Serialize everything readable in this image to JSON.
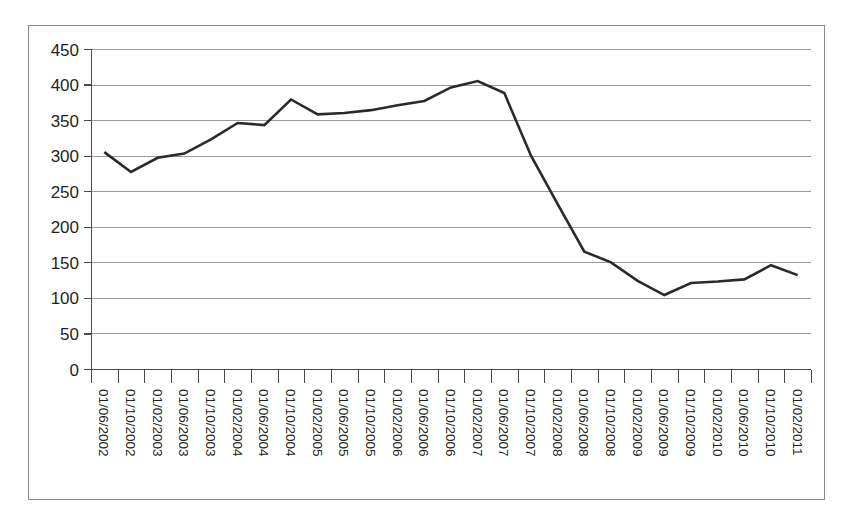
{
  "chart_data": {
    "type": "line",
    "title": "",
    "subtitle": "",
    "xlabel": "",
    "ylabel": "",
    "ylim": [
      0,
      450
    ],
    "ytick_labels": [
      "0",
      "50",
      "100",
      "150",
      "200",
      "250",
      "300",
      "350",
      "400",
      "450"
    ],
    "ytick_values": [
      0,
      50,
      100,
      150,
      200,
      250,
      300,
      350,
      400,
      450
    ],
    "grid": "horizontal",
    "legend": "none",
    "legend_entries": [],
    "annotations": [],
    "categories": [
      "01/06/2002",
      "01/10/2002",
      "01/02/2003",
      "01/06/2003",
      "01/10/2003",
      "01/02/2004",
      "01/06/2004",
      "01/10/2004",
      "01/02/2005",
      "01/06/2005",
      "01/10/2005",
      "01/02/2006",
      "01/06/2006",
      "01/10/2006",
      "01/02/2007",
      "01/06/2007",
      "01/10/2007",
      "01/02/2008",
      "01/06/2008",
      "01/10/2008",
      "01/02/2009",
      "01/06/2009",
      "01/10/2009",
      "01/02/2010",
      "01/06/2010",
      "01/10/2010",
      "01/02/2011"
    ],
    "values": [
      305,
      277,
      297,
      303,
      323,
      346,
      343,
      379,
      358,
      360,
      364,
      371,
      377,
      396,
      405,
      388,
      300,
      232,
      165,
      150,
      124,
      104,
      121,
      123,
      126,
      146,
      132
    ],
    "series": [
      {
        "name": "series-1",
        "color": "#2a2a2a",
        "values": [
          305,
          277,
          297,
          303,
          323,
          346,
          343,
          379,
          358,
          360,
          364,
          371,
          377,
          396,
          405,
          388,
          300,
          232,
          165,
          150,
          124,
          104,
          121,
          123,
          126,
          146,
          132
        ]
      }
    ]
  },
  "style": {
    "line_color": "#2a2a2a",
    "grid_color": "#9a9a9a",
    "axis_color": "#4a4a4a",
    "frame_color": "#8a8a8a",
    "text_color": "#231f20",
    "background": "#ffffff"
  }
}
